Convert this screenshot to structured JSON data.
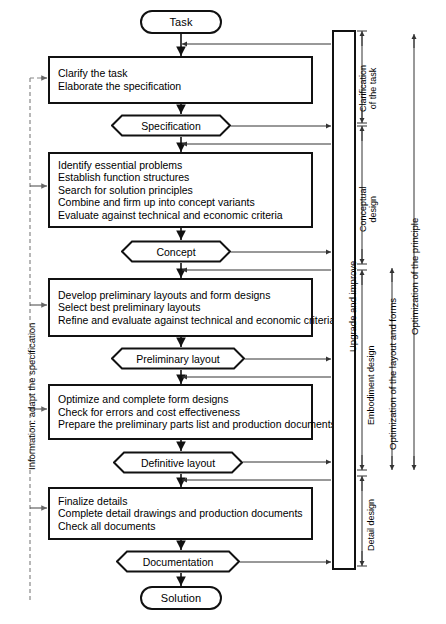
{
  "diagram": {
    "start_node": {
      "label": "Task"
    },
    "end_node": {
      "label": "Solution"
    },
    "stages": [
      {
        "id": "clarify",
        "steps": [
          "Clarify the task",
          "Elaborate the specification"
        ],
        "result": "Specification"
      },
      {
        "id": "conceptual",
        "steps": [
          "Identify essential problems",
          "Establish function structures",
          "Search for solution principles",
          "Combine and firm up into concept variants",
          "Evaluate against technical and economic criteria"
        ],
        "result": "Concept"
      },
      {
        "id": "preliminary",
        "steps": [
          "Develop preliminary layouts and form designs",
          "Select best preliminary layouts",
          "Refine and evaluate against technical and economic criteria"
        ],
        "result": "Preliminary layout"
      },
      {
        "id": "definitive",
        "steps": [
          "Optimize and complete form designs",
          "Check for errors and cost effectiveness",
          "Prepare the preliminary parts list and production documents"
        ],
        "result": "Definitive layout"
      },
      {
        "id": "detail",
        "steps": [
          "Finalize details",
          "Complete detail drawings and production documents",
          "Check all documents"
        ],
        "result": "Documentation"
      }
    ],
    "feedback_bar": {
      "label": "Upgrade and improve"
    },
    "left_annotation": {
      "label": "Information: adapt the specification"
    },
    "phase_labels": [
      {
        "id": "clarification",
        "line1": "Clarification",
        "line2": "of the task"
      },
      {
        "id": "conceptual-design",
        "line1": "Conceptual",
        "line2": "design"
      },
      {
        "id": "embodiment-design",
        "line1": "Embodiment design",
        "line2": ""
      },
      {
        "id": "detail-design",
        "line1": "Detail design",
        "line2": ""
      }
    ],
    "optimization_labels": [
      {
        "id": "layout-and-forms",
        "label": "Optimization of the layout and forms"
      },
      {
        "id": "principle",
        "label": "Optimization of the principle"
      }
    ],
    "colors": {
      "stroke": "#111111",
      "thin": "#444444",
      "dashed": "#777777",
      "background": "#ffffff"
    }
  }
}
